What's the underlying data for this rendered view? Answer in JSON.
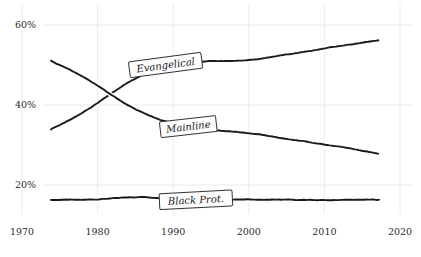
{
  "chart_data": {
    "type": "line",
    "title": "",
    "subtitle": "",
    "xlabel": "",
    "ylabel": "",
    "xlim": [
      1970,
      2020
    ],
    "ylim": [
      10,
      62
    ],
    "grid": true,
    "legend_position": "inline-labels",
    "style": "hand-drawn",
    "x_ticks": [
      1970,
      1980,
      1990,
      2000,
      2010,
      2020
    ],
    "x_tick_labels": [
      "1970",
      "1980",
      "1990",
      "2000",
      "2010",
      "2020"
    ],
    "y_ticks": [
      20,
      40,
      60
    ],
    "y_tick_labels": [
      "20%",
      "40%",
      "60%"
    ],
    "x": [
      1973,
      1975,
      1977,
      1980,
      1981,
      1983,
      1985,
      1987,
      1989,
      1990,
      1992,
      1995,
      1998,
      2000,
      2003,
      2006,
      2009,
      2012,
      2015,
      2018
    ],
    "series": [
      {
        "name": "Evangelical",
        "label": "Evangelical",
        "color": "#1a1a1a",
        "values": [
          33.0,
          35.0,
          37.1,
          40.5,
          41.8,
          44.6,
          46.7,
          48.6,
          49.9,
          50.3,
          50.7,
          51.0,
          51.1,
          51.3,
          52.0,
          52.9,
          53.8,
          54.7,
          55.6,
          56.5
        ],
        "label_point": {
          "x": 1989,
          "y": 50.0
        }
      },
      {
        "name": "Mainline",
        "label": "Mainline",
        "color": "#1a1a1a",
        "values": [
          51.8,
          50.1,
          48.2,
          45.0,
          43.6,
          41.0,
          38.9,
          37.1,
          35.7,
          35.2,
          34.5,
          33.8,
          33.3,
          33.0,
          32.2,
          31.3,
          30.4,
          29.5,
          28.5,
          27.5
        ],
        "label_point": {
          "x": 1992,
          "y": 34.6
        }
      },
      {
        "name": "Black Prot.",
        "label": "Black Prot.",
        "color": "#1a1a1a",
        "values": [
          16.3,
          16.3,
          16.4,
          16.5,
          16.6,
          16.8,
          17.0,
          16.9,
          16.6,
          16.5,
          16.4,
          16.3,
          16.3,
          16.3,
          16.3,
          16.3,
          16.3,
          16.3,
          16.3,
          16.3
        ],
        "label_point": {
          "x": 1993,
          "y": 16.3
        }
      }
    ]
  },
  "axes": {
    "y_tick_0": "60%",
    "y_tick_1": "40%",
    "y_tick_2": "20%",
    "x_tick_0": "1970",
    "x_tick_1": "1980",
    "x_tick_2": "1990",
    "x_tick_3": "2000",
    "x_tick_4": "2010",
    "x_tick_5": "2020"
  },
  "labels": {
    "evangelical": "Evangelical",
    "mainline": "Mainline",
    "black_prot": "Black Prot."
  },
  "colors": {
    "line": "#1a1a1a",
    "grid": "#e8e8ee",
    "text": "#2b2b2b",
    "label_box_fill": "#fdfdfd",
    "label_box_stroke": "#333333",
    "background": "#ffffff"
  }
}
